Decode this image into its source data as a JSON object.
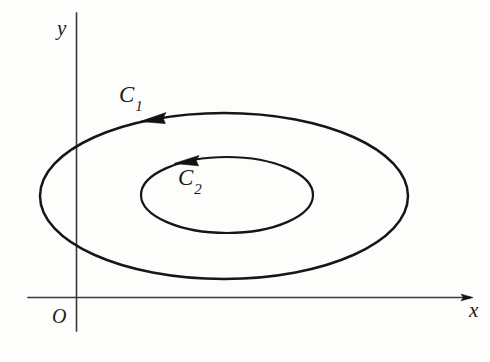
{
  "figure": {
    "background_color": "#fdfdfc",
    "stroke_color": "#161616",
    "axis_color": "#3a3a3a"
  },
  "axes": {
    "x_label": "x",
    "y_label": "y",
    "origin_label": "O",
    "x_axis": {
      "start_x": 28,
      "end_x": 473,
      "y": 297,
      "has_arrow": true,
      "arrow_direction": "right"
    },
    "y_axis": {
      "x": 76,
      "start_y": 13,
      "end_y": 331,
      "has_arrow": false
    }
  },
  "curves": [
    {
      "name": "C1",
      "label": "C",
      "subscript": "1",
      "type": "ellipse",
      "center_x": 224,
      "center_y": 196,
      "radius_x": 184,
      "radius_y": 83,
      "orientation": "counterclockwise",
      "arrow_at_x": 152,
      "arrow_at_y": 118,
      "arrow_direction": "left",
      "stroke_width": 2.5,
      "label_x": 119,
      "label_y": 83
    },
    {
      "name": "C2",
      "label": "C",
      "subscript": "2",
      "type": "ellipse",
      "center_x": 227,
      "center_y": 195,
      "radius_x": 86,
      "radius_y": 38,
      "orientation": "counterclockwise",
      "arrow_at_x": 187,
      "arrow_at_y": 158,
      "arrow_direction": "left",
      "stroke_width": 2.2,
      "label_x": 178,
      "label_y": 166
    }
  ]
}
